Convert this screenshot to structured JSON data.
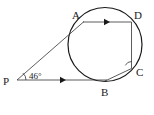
{
  "figure": {
    "kind": "geometry-diagram",
    "width": 154,
    "height": 115,
    "background_color": "#ffffff",
    "stroke_color": "#1a1a1a"
  },
  "labels": {
    "point_a": "A",
    "point_b": "B",
    "point_c": "C",
    "point_d": "D",
    "point_p": "P",
    "angle_p": "46°"
  },
  "geometry": {
    "circle": {
      "cx": 105,
      "cy": 44.5,
      "r": 37
    },
    "points": {
      "A": {
        "x": 83,
        "y": 22
      },
      "B": {
        "x": 105,
        "y": 81
      },
      "C": {
        "x": 131,
        "y": 68
      },
      "D": {
        "x": 131,
        "y": 22
      },
      "P": {
        "x": 17,
        "y": 80
      }
    },
    "segments": [
      {
        "name": "PA",
        "from": "P",
        "to": "A"
      },
      {
        "name": "PB",
        "from": "P",
        "to": "B"
      },
      {
        "name": "AD",
        "from": "A",
        "to": "D"
      },
      {
        "name": "DC",
        "from": "D",
        "to": "C"
      },
      {
        "name": "BC",
        "from": "B",
        "to": "C"
      }
    ],
    "arrow_markers": [
      {
        "on": "AD",
        "x": 107,
        "y": 22,
        "direction": "right"
      },
      {
        "on": "PB",
        "x": 63,
        "y": 79.5,
        "direction": "right"
      }
    ],
    "angle_arc_p": {
      "cx": 17,
      "cy": 80,
      "r": 9
    },
    "angle_arc_c": {
      "cx": 131,
      "cy": 68,
      "r": 7
    }
  },
  "label_positions": {
    "A": {
      "x": 72,
      "y": 19
    },
    "B": {
      "x": 101,
      "y": 96
    },
    "C": {
      "x": 136,
      "y": 75
    },
    "D": {
      "x": 134,
      "y": 19
    },
    "P": {
      "x": 3,
      "y": 84
    },
    "angle_p": {
      "x": 29,
      "y": 78
    }
  }
}
